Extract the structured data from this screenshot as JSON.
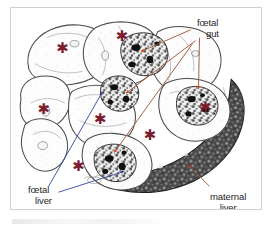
{
  "figure": {
    "type": "annotated-histology-cross-section",
    "background_color": "#ffffff",
    "frame_border_color": "#cfcfcf"
  },
  "labels": [
    {
      "id": "foetal-gut",
      "line1": "fœtal",
      "line2": "gut",
      "color": "#262626",
      "leader_color": "#a4563a"
    },
    {
      "id": "foetal-liver",
      "line1": "fœtal",
      "line2": "liver",
      "color": "#262626",
      "leader_color": "#3a4f9c"
    },
    {
      "id": "maternal-liver",
      "line1": "maternal",
      "line2": "liver",
      "color": "#262626",
      "leader_color": "#a4563a"
    }
  ],
  "markers": {
    "asterisk_glyph": "✱",
    "asterisk_color": "#7b1b2e",
    "asterisk_label": "foetal body section",
    "asterisk_count": 7,
    "asterisk_positions": [
      {
        "x": 52,
        "y": 40
      },
      {
        "x": 112,
        "y": 28
      },
      {
        "x": 33,
        "y": 102
      },
      {
        "x": 90,
        "y": 112
      },
      {
        "x": 140,
        "y": 128
      },
      {
        "x": 196,
        "y": 100
      },
      {
        "x": 68,
        "y": 160
      }
    ]
  },
  "arrows": {
    "gut_arrow_color": "#d94512",
    "gut_arrow_count": 4,
    "liver_arrow_color": "#2c3f8f",
    "liver_arrow_count": 2,
    "maternal_arrow_color": "#c42a18",
    "maternal_arrow_count": 1
  },
  "tissues": {
    "foetal_outline_color": "#4a4a4a",
    "foetal_fill_color": "#fdfdfd",
    "gut_tissue_color": "#2b2b2b",
    "maternal_liver_color": "#3a3a3a",
    "maternal_liver_texture": "mottled-speckled"
  }
}
